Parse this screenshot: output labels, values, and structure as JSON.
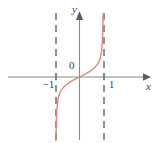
{
  "figure": {
    "background_color": "#ffffff",
    "width": 161,
    "height": 143
  },
  "labels": {
    "y_axis": "y",
    "x_axis": "x",
    "origin": "0",
    "tick_negative_one": "−1",
    "tick_positive_one": "1"
  },
  "chart_data": {
    "type": "line",
    "title": "",
    "subtitle": "",
    "xlabel": "x",
    "ylabel": "y",
    "xlim": [
      -1.6,
      1.6
    ],
    "ylim": [
      -7.5,
      7.5
    ],
    "grid": false,
    "legend": null,
    "axes": {
      "x_axis_color": "#7a7a7a",
      "y_axis_color": "#7a7a7a",
      "x_axis_arrow": "right",
      "y_axis_arrow": "up",
      "x_ticks": [
        -1,
        1
      ],
      "x_tick_labels": [
        "−1",
        "1"
      ],
      "y_ticks": [],
      "y_tick_labels": []
    },
    "annotations": [
      {
        "text": "0",
        "x": -0.1,
        "y": 0.55,
        "role": "origin-label"
      },
      {
        "text": "y",
        "x": -0.12,
        "y": 7.2,
        "role": "y-axis-name"
      },
      {
        "text": "x",
        "x": 1.52,
        "y": -0.6,
        "role": "x-axis-name"
      }
    ],
    "asymptotes": [
      {
        "type": "vertical",
        "x": -1,
        "style": "dashed",
        "color": "#6e6e6e"
      },
      {
        "type": "vertical",
        "x": 1,
        "style": "dashed",
        "color": "#6e6e6e"
      }
    ],
    "series": [
      {
        "name": "curve",
        "color": "#dd8877",
        "linewidth": 1.4,
        "comment": "odd increasing rational-type curve through origin with vertical asymptotes at x=±1",
        "x": [
          -0.985,
          -0.97,
          -0.95,
          -0.92,
          -0.88,
          -0.84,
          -0.8,
          -0.74,
          -0.68,
          -0.6,
          -0.52,
          -0.44,
          -0.36,
          -0.28,
          -0.2,
          -0.12,
          -0.06,
          0,
          0.06,
          0.12,
          0.2,
          0.28,
          0.36,
          0.44,
          0.52,
          0.6,
          0.68,
          0.74,
          0.8,
          0.84,
          0.88,
          0.92,
          0.95,
          0.97,
          0.985
        ],
        "y": [
          -7.4,
          -5.6,
          -4.1,
          -3.05,
          -2.4,
          -2.0,
          -1.72,
          -1.45,
          -1.24,
          -1.02,
          -0.84,
          -0.68,
          -0.53,
          -0.4,
          -0.28,
          -0.16,
          -0.08,
          0,
          0.08,
          0.16,
          0.28,
          0.4,
          0.53,
          0.68,
          0.84,
          1.02,
          1.24,
          1.45,
          1.72,
          2.0,
          2.4,
          3.05,
          4.1,
          5.6,
          7.4
        ]
      }
    ]
  }
}
